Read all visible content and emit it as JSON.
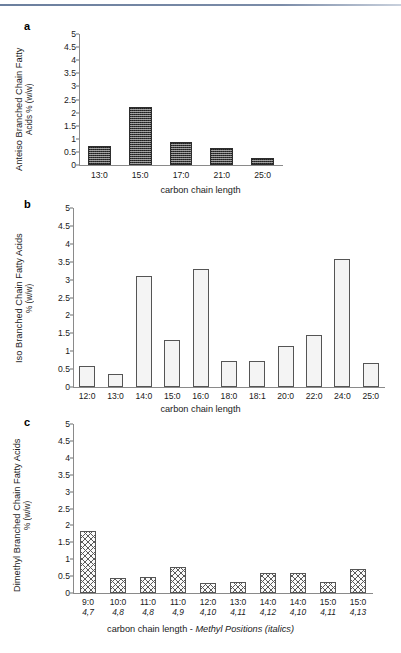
{
  "figure": {
    "panels": [
      "a",
      "b",
      "c"
    ],
    "shared_ytick_labels": [
      "5",
      "4.5",
      "4",
      "3.5",
      "3",
      "2.5",
      "2",
      "1.5",
      "1",
      "0.5",
      "0"
    ],
    "xaxis_title_ab": "carbon chain length",
    "xaxis_title_c_plain": "carbon chain length - ",
    "xaxis_title_c_italic": "Methyl Positions (italics)"
  },
  "panel_a": {
    "letter": "a",
    "ytitle_line1": "Anteiso Branched Chain Fatty",
    "ytitle_line2": "Acids % (w/w)"
  },
  "panel_b": {
    "letter": "b",
    "ytitle_line1": "Iso Branched Chain Fatty Acids",
    "ytitle_line2": "% (w/w)"
  },
  "panel_c": {
    "letter": "c",
    "ytitle_line1": "Dimethyl Branched Chain Fatty Acids",
    "ytitle_line2": "% (w/w)"
  },
  "chart_data": [
    {
      "panel": "a",
      "type": "bar",
      "title": "",
      "xlabel": "carbon chain length",
      "ylabel": "Anteiso Branched Chain Fatty Acids % (w/w)",
      "ylim": [
        0,
        5
      ],
      "ytick_values": [
        0,
        0.5,
        1,
        1.5,
        2,
        2.5,
        3,
        3.5,
        4,
        4.5,
        5
      ],
      "grid": false,
      "legend": "none",
      "fill_style": "dark-checker",
      "categories": [
        "13:0",
        "15:0",
        "17:0",
        "21:0",
        "25:0"
      ],
      "values": [
        0.72,
        2.2,
        0.88,
        0.65,
        0.28
      ]
    },
    {
      "panel": "b",
      "type": "bar",
      "title": "",
      "xlabel": "carbon chain length",
      "ylabel": "Iso Branched Chain Fatty Acids % (w/w)",
      "ylim": [
        0,
        5
      ],
      "ytick_values": [
        0,
        0.5,
        1,
        1.5,
        2,
        2.5,
        3,
        3.5,
        4,
        4.5,
        5
      ],
      "grid": false,
      "legend": "none",
      "fill_style": "light-dot",
      "categories": [
        "12:0",
        "13:0",
        "14:0",
        "15:0",
        "16:0",
        "18:0",
        "18:1",
        "20:0",
        "22:0",
        "24:0",
        "25:0"
      ],
      "values": [
        0.58,
        0.35,
        3.1,
        1.3,
        3.3,
        0.73,
        0.72,
        1.15,
        1.45,
        3.57,
        0.67
      ]
    },
    {
      "panel": "c",
      "type": "bar",
      "title": "",
      "xlabel": "carbon chain length - Methyl Positions (italics)",
      "ylabel": "Dimethyl Branched Chain Fatty Acids % (w/w)",
      "ylim": [
        0,
        5
      ],
      "ytick_values": [
        0,
        0.5,
        1,
        1.5,
        2,
        2.5,
        3,
        3.5,
        4,
        4.5,
        5
      ],
      "grid": false,
      "legend": "none",
      "fill_style": "diagonal-hatch",
      "categories": [
        "9:0",
        "10:0",
        "11:0",
        "11:0",
        "12:0",
        "13:0",
        "14:0",
        "14:0",
        "15:0",
        "15:0"
      ],
      "methyl_positions": [
        "4,7",
        "4,8",
        "4,8",
        "4,9",
        "4,10",
        "4,11",
        "4,12",
        "4,10",
        "4,11",
        "4,13"
      ],
      "values": [
        1.82,
        0.43,
        0.46,
        0.77,
        0.29,
        0.34,
        0.6,
        0.6,
        0.33,
        0.71
      ]
    }
  ]
}
